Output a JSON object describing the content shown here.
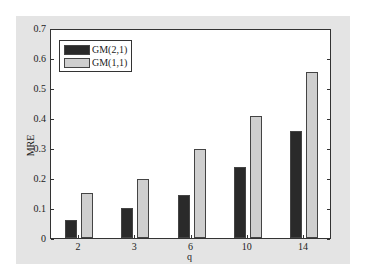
{
  "chart_data": {
    "type": "bar",
    "title": "",
    "xlabel": "q",
    "ylabel": "MRE",
    "categories": [
      "2",
      "3",
      "6",
      "10",
      "14"
    ],
    "series": [
      {
        "name": "GM(2,1)",
        "color": "#2a2a2a",
        "values": [
          0.06,
          0.1,
          0.145,
          0.24,
          0.36
        ]
      },
      {
        "name": "GM(1,1)",
        "color": "#cfcfcf",
        "values": [
          0.15,
          0.2,
          0.3,
          0.41,
          0.56
        ]
      }
    ],
    "ylim": [
      0,
      0.7
    ],
    "yticks": [
      "0",
      "0.1",
      "0.2",
      "0.3",
      "0.4",
      "0.5",
      "0.6",
      "0.7"
    ],
    "grid": false,
    "legend_position": "upper left"
  }
}
